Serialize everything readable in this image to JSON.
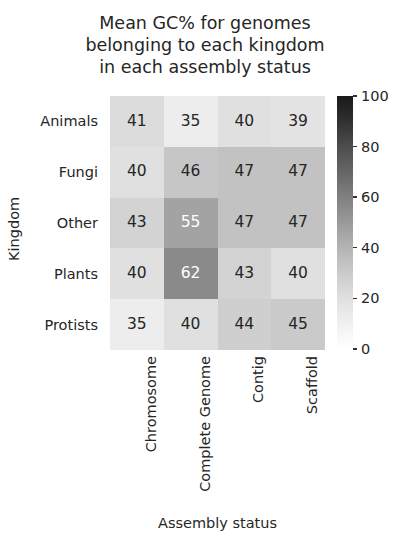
{
  "chart_data": {
    "type": "heatmap",
    "title": "Mean GC% for genomes\nbelonging to each kingdom\nin each assembly status",
    "xlabel": "Assembly status",
    "ylabel": "Kingdom",
    "categories_x": [
      "Chromosome",
      "Complete Genome",
      "Contig",
      "Scaffold"
    ],
    "categories_y": [
      "Animals",
      "Fungi",
      "Other",
      "Plants",
      "Protists"
    ],
    "values": [
      [
        41,
        35,
        40,
        39
      ],
      [
        40,
        46,
        47,
        47
      ],
      [
        43,
        55,
        47,
        47
      ],
      [
        40,
        62,
        43,
        40
      ],
      [
        35,
        40,
        44,
        45
      ]
    ],
    "cells": [
      {
        "row": "Animals",
        "col": "Chromosome",
        "value": 41,
        "bg": "#dcdcdc",
        "fg": "#262626"
      },
      {
        "row": "Animals",
        "col": "Complete Genome",
        "value": 35,
        "bg": "#ededed",
        "fg": "#262626"
      },
      {
        "row": "Animals",
        "col": "Contig",
        "value": 40,
        "bg": "#e0e0e0",
        "fg": "#262626"
      },
      {
        "row": "Animals",
        "col": "Scaffold",
        "value": 39,
        "bg": "#e3e3e3",
        "fg": "#262626"
      },
      {
        "row": "Fungi",
        "col": "Chromosome",
        "value": 40,
        "bg": "#e0e0e0",
        "fg": "#262626"
      },
      {
        "row": "Fungi",
        "col": "Complete Genome",
        "value": 46,
        "bg": "#c6c6c6",
        "fg": "#262626"
      },
      {
        "row": "Fungi",
        "col": "Contig",
        "value": 47,
        "bg": "#c2c2c2",
        "fg": "#262626"
      },
      {
        "row": "Fungi",
        "col": "Scaffold",
        "value": 47,
        "bg": "#c2c2c2",
        "fg": "#262626"
      },
      {
        "row": "Other",
        "col": "Chromosome",
        "value": 43,
        "bg": "#d3d3d3",
        "fg": "#262626"
      },
      {
        "row": "Other",
        "col": "Complete Genome",
        "value": 55,
        "bg": "#a3a3a3",
        "fg": "#ffffff"
      },
      {
        "row": "Other",
        "col": "Contig",
        "value": 47,
        "bg": "#c2c2c2",
        "fg": "#262626"
      },
      {
        "row": "Other",
        "col": "Scaffold",
        "value": 47,
        "bg": "#c2c2c2",
        "fg": "#262626"
      },
      {
        "row": "Plants",
        "col": "Chromosome",
        "value": 40,
        "bg": "#e0e0e0",
        "fg": "#262626"
      },
      {
        "row": "Plants",
        "col": "Complete Genome",
        "value": 62,
        "bg": "#8a8a8a",
        "fg": "#ffffff"
      },
      {
        "row": "Plants",
        "col": "Contig",
        "value": 43,
        "bg": "#d3d3d3",
        "fg": "#262626"
      },
      {
        "row": "Plants",
        "col": "Scaffold",
        "value": 40,
        "bg": "#e0e0e0",
        "fg": "#262626"
      },
      {
        "row": "Protists",
        "col": "Chromosome",
        "value": 35,
        "bg": "#ededed",
        "fg": "#262626"
      },
      {
        "row": "Protists",
        "col": "Complete Genome",
        "value": 40,
        "bg": "#e0e0e0",
        "fg": "#262626"
      },
      {
        "row": "Protists",
        "col": "Contig",
        "value": 44,
        "bg": "#cfcfcf",
        "fg": "#262626"
      },
      {
        "row": "Protists",
        "col": "Scaffold",
        "value": 45,
        "bg": "#cacaca",
        "fg": "#262626"
      }
    ],
    "colorbar": {
      "min": 0,
      "max": 100,
      "ticks": [
        100,
        80,
        60,
        40,
        20,
        0
      ],
      "colormap": "greys",
      "position": "right"
    },
    "grid": false
  }
}
